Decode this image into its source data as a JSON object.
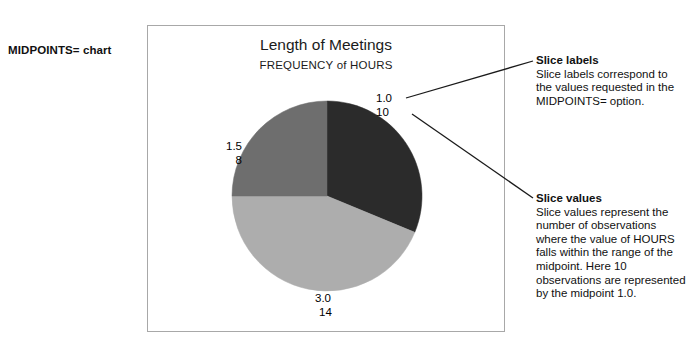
{
  "side_caption": "MIDPOINTS= chart",
  "chart_data": {
    "type": "pie",
    "title": "Length of Meetings",
    "subtitle": "FREQUENCY of HOURS",
    "xlabel": "",
    "ylabel": "",
    "legend": "none",
    "grid": false,
    "categories": [
      "1.0",
      "1.5",
      "3.0"
    ],
    "values": [
      10,
      8,
      14
    ],
    "total": 32,
    "slices": [
      {
        "midpoint": "1.0",
        "count": "10",
        "value": 10,
        "color": "#2b2b2b",
        "start_deg": 0,
        "end_deg": 112.5
      },
      {
        "midpoint": "3.0",
        "count": "14",
        "value": 14,
        "color": "#adadad",
        "start_deg": 112.5,
        "end_deg": 270.0
      },
      {
        "midpoint": "1.5",
        "count": "8",
        "value": 8,
        "color": "#6e6e6e",
        "start_deg": 270.0,
        "end_deg": 360.0
      }
    ],
    "axis_note": "Slice labels show midpoint above observation count"
  },
  "annotations": [
    {
      "heading": "Slice labels",
      "body": "Slice labels correspond to the values requested in the MIDPOINTS= option."
    },
    {
      "heading": "Slice values",
      "body": "Slice values represent the number of observations where the value of HOURS falls within the range of the midpoint. Here 10 observations are represented by the midpoint 1.0."
    }
  ]
}
